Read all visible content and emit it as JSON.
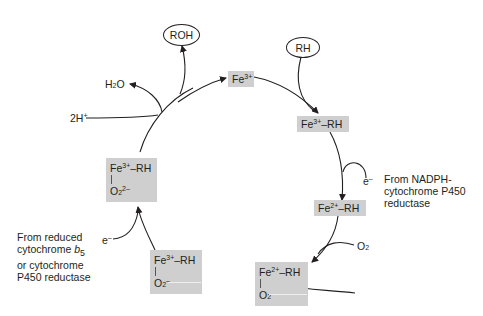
{
  "diagram": {
    "species": {
      "fe3": {
        "base": "Fe",
        "charge": "3+"
      },
      "fe3_rh": {
        "base": "Fe",
        "charge": "3+",
        "suffix": "–RH"
      },
      "fe2_rh": {
        "base": "Fe",
        "charge": "2+",
        "suffix": "–RH"
      },
      "fe2_rh_o2": {
        "base": "Fe",
        "charge": "2+",
        "suffix": "–RH",
        "ligand": "O",
        "ligand_sub": "2",
        "ligand_charge": ""
      },
      "fe3_rh_o2_minus": {
        "base": "Fe",
        "charge": "3+",
        "suffix": "–RH",
        "ligand": "O",
        "ligand_sub": "2",
        "ligand_charge": "–"
      },
      "fe3_rh_o2_2minus": {
        "base": "Fe",
        "charge": "3+",
        "suffix": "–RH",
        "ligand": "O",
        "ligand_sub": "2",
        "ligand_charge": "2–"
      }
    },
    "inputs": {
      "substrate": "RH",
      "electron_1": {
        "base": "e",
        "charge": "–"
      },
      "oxygen": {
        "base": "O",
        "sub": "2"
      },
      "electron_2": {
        "base": "e",
        "charge": "–"
      },
      "protons": {
        "base": "2H",
        "charge": "+"
      }
    },
    "outputs": {
      "product": "ROH",
      "water": {
        "pre": "H",
        "sub": "2",
        "post": "O"
      }
    },
    "notes": {
      "nadph": [
        "From NADPH-",
        "cytochrome P450",
        "reductase"
      ],
      "reduced_b5": {
        "line1": "From reduced",
        "line2_pre": "cytochrome ",
        "line2_italic": "b",
        "line2_sub": "5",
        "line3": "or cytochrome",
        "line4": "P450 reductase"
      }
    },
    "colors": {
      "box_fill": "#cfcfcf",
      "ink": "#231f20",
      "background": "#ffffff"
    }
  }
}
